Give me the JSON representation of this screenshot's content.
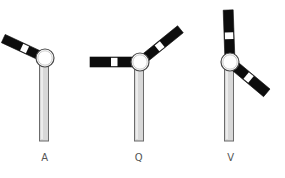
{
  "diagram": {
    "background_color": "#ffffff",
    "colors": {
      "arm_black": "#0d0d0d",
      "arm_band_white": "#ffffff",
      "post_fill": "#d8d8d8",
      "post_stroke": "#6b6b6b",
      "hub_fill": "#ffffff",
      "hub_stroke": "#4a4a4a",
      "label_text": "#555555"
    },
    "figures": [
      {
        "id": "A",
        "label": "A",
        "label_x": 45,
        "label_y": 160,
        "post": {
          "x": 44,
          "top_y": 58,
          "bottom_y": 141,
          "width": 9
        },
        "hub": {
          "cx": 45,
          "cy": 58,
          "r": 9
        },
        "arms": [
          {
            "name": "lower-left-arm",
            "angle_deg": 205,
            "length": 46,
            "thickness": 9,
            "band_start": 0.42,
            "band_end": 0.56
          }
        ]
      },
      {
        "id": "Q",
        "label": "Q",
        "label_x": 139,
        "label_y": 160,
        "post": {
          "x": 139,
          "top_y": 62,
          "bottom_y": 141,
          "width": 9
        },
        "hub": {
          "cx": 140,
          "cy": 62,
          "r": 9
        },
        "arms": [
          {
            "name": "left-horizontal-arm",
            "angle_deg": 180,
            "length": 50,
            "thickness": 10,
            "band_start": 0.45,
            "band_end": 0.58
          },
          {
            "name": "upper-right-arm",
            "angle_deg": 321,
            "length": 52,
            "thickness": 9,
            "band_start": 0.42,
            "band_end": 0.55
          }
        ]
      },
      {
        "id": "V",
        "label": "V",
        "label_x": 231,
        "label_y": 160,
        "post": {
          "x": 229,
          "top_y": 62,
          "bottom_y": 141,
          "width": 9
        },
        "hub": {
          "cx": 230,
          "cy": 62,
          "r": 9
        },
        "arms": [
          {
            "name": "upper-vertical-arm",
            "angle_deg": 268,
            "length": 52,
            "thickness": 10,
            "band_start": 0.44,
            "band_end": 0.57
          },
          {
            "name": "lower-right-arm",
            "angle_deg": 40,
            "length": 48,
            "thickness": 10,
            "band_start": 0.44,
            "band_end": 0.57
          }
        ]
      }
    ]
  }
}
